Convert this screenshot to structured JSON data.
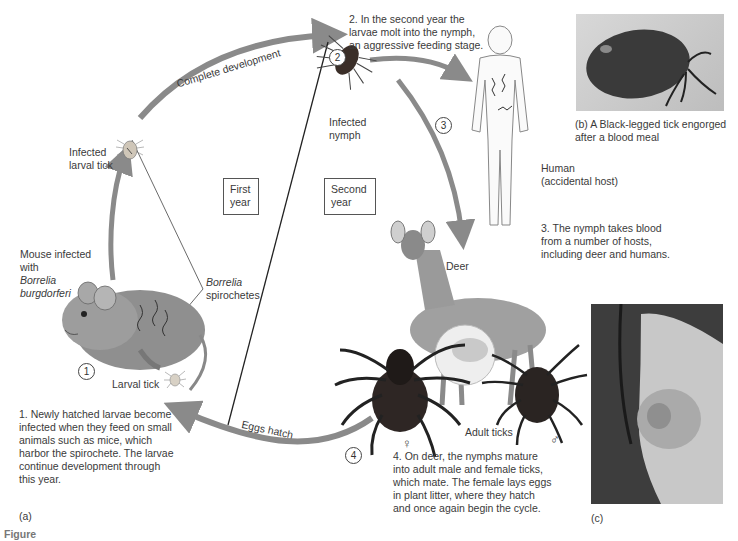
{
  "labels": {
    "step2_text": [
      "2. In the second year the",
      "larvae molt into the nymph,",
      "an aggressive feeding stage."
    ],
    "complete_development": "Complete development",
    "infected_larval_tick": [
      "Infected",
      "larval tick"
    ],
    "infected_nymph": [
      "Infected",
      "nymph"
    ],
    "first_year": [
      "First",
      "year"
    ],
    "second_year": [
      "Second",
      "year"
    ],
    "borrelia_spirochetes": [
      "Borrelia",
      "spirochetes"
    ],
    "mouse_infected": [
      "Mouse infected",
      "with"
    ],
    "borrelia_burgdorferi": [
      "Borrelia",
      "burgdorferi"
    ],
    "larval_tick": "Larval tick",
    "step1_text": [
      "1. Newly hatched larvae become",
      "infected when they feed on small",
      "animals such as mice, which",
      "harbor the spirochete. The larvae",
      "continue development through",
      "this year."
    ],
    "panel_a": "(a)",
    "eggs_hatch": "Eggs hatch",
    "human": [
      "Human",
      "(accidental host)"
    ],
    "step3_text": [
      "3. The nymph takes blood",
      "from a number of hosts,",
      "including deer and humans."
    ],
    "deer": "Deer",
    "adult_ticks": "Adult ticks",
    "female_symbol": "♀",
    "male_symbol": "♂",
    "step4_text": [
      "4. On deer, the nymphs mature",
      "into adult male and female ticks,",
      "which mate. The female lays eggs",
      "in plant litter, where they hatch",
      "and once again begin the cycle."
    ],
    "panel_b_caption": [
      "(b) A Black-legged tick engorged",
      "after a blood meal"
    ],
    "panel_c": "(c)",
    "figure_caption_cut": "Figure"
  },
  "step_numbers": [
    "1",
    "2",
    "3",
    "4"
  ],
  "colors": {
    "arrow": "#8a8a8a",
    "text": "#3a3a3a",
    "line": "#222222"
  }
}
